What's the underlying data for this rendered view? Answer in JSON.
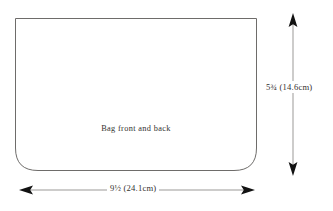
{
  "diagram": {
    "type": "sewing-pattern-piece",
    "piece": {
      "label": "Bag front and back",
      "shape": "rectangle with rounded bottom corners",
      "outline_color": "#6e6c6a",
      "fill_color": "#ffffff"
    },
    "dimensions": {
      "height": {
        "label": "5¾ (14.6cm)",
        "inches": "5¾",
        "metric": "14.6cm",
        "orientation": "vertical",
        "arrow": "double-headed"
      },
      "width": {
        "label": "9½ (24.1cm)",
        "inches": "9½",
        "metric": "24.1cm",
        "orientation": "horizontal",
        "arrow": "double-headed"
      }
    },
    "colors": {
      "line": "#6e6c6a",
      "arrow": "#8a8886",
      "arrowhead": "#1a1a1a",
      "text": "#33312f",
      "background": "#ffffff"
    }
  }
}
